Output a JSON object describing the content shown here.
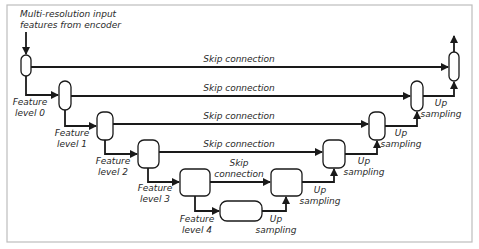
{
  "diagram": {
    "input_label_line1": "Multi-resolution input",
    "input_label_line2": "features from encoder",
    "skip_labels": [
      "Skip connection",
      "Skip connection",
      "Skip connection",
      "Skip connection"
    ],
    "skip_label_split": [
      "Skip",
      "connection"
    ],
    "feature_levels": [
      {
        "line1": "Feature",
        "line2": "level 0"
      },
      {
        "line1": "Feature",
        "line2": "level 1"
      },
      {
        "line1": "Feature",
        "line2": "level 2"
      },
      {
        "line1": "Feature",
        "line2": "level 3"
      },
      {
        "line1": "Feature",
        "line2": "level 4"
      }
    ],
    "up_sampling": [
      {
        "line1": "Up",
        "line2": "sampling"
      },
      {
        "line1": "Up",
        "line2": "sampling"
      },
      {
        "line1": "Up",
        "line2": "sampling"
      },
      {
        "line1": "Up",
        "line2": "sampling"
      },
      {
        "line1": "Up",
        "line2": "sampling"
      }
    ],
    "colors": {
      "stroke": "#1a1a1a",
      "frame": "#bdbdbd",
      "text": "#2a2a2a"
    }
  }
}
